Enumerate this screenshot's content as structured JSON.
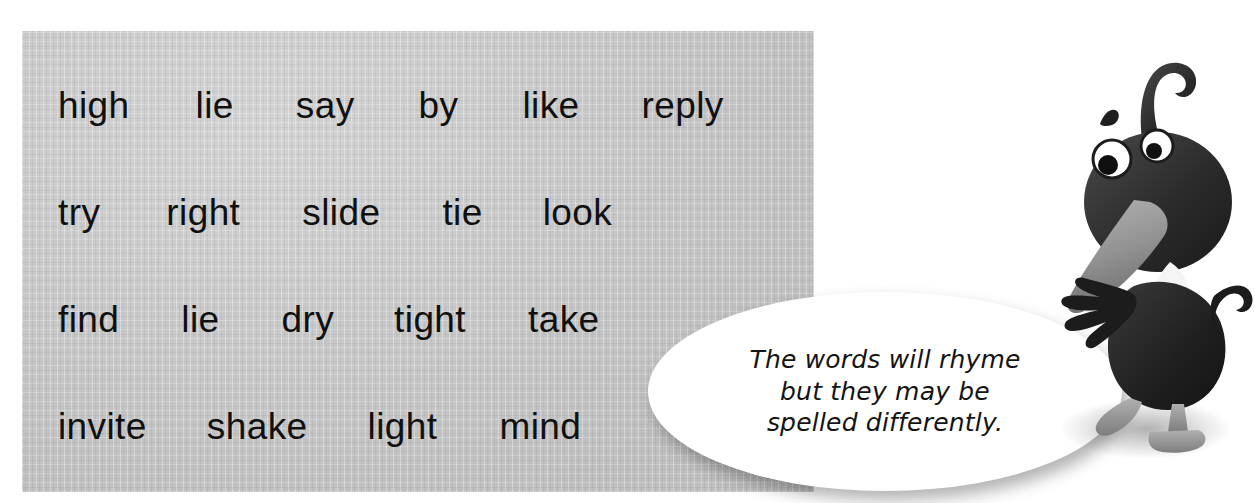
{
  "page": {
    "type": "worksheet-illustration",
    "background_color": "#ffffff"
  },
  "word_panel": {
    "name": "word-list-panel",
    "background_color": "#c9c9c9",
    "text_color": "#101010",
    "rows": [
      {
        "words": [
          "high",
          "lie",
          "say",
          "by",
          "like",
          "reply"
        ]
      },
      {
        "words": [
          "try",
          "right",
          "slide",
          "tie",
          "look"
        ]
      },
      {
        "words": [
          "find",
          "lie",
          "dry",
          "tight",
          "take"
        ]
      },
      {
        "words": [
          "invite",
          "shake",
          "light",
          "mind"
        ]
      }
    ],
    "all_words": [
      "high",
      "lie",
      "say",
      "by",
      "like",
      "reply",
      "try",
      "right",
      "slide",
      "tie",
      "look",
      "find",
      "lie",
      "dry",
      "tight",
      "take",
      "invite",
      "shake",
      "light",
      "mind"
    ]
  },
  "speech_bubble": {
    "name": "speech-bubble",
    "background_color": "#ffffff",
    "text_color": "#141414",
    "lines": [
      "The words will rhyme",
      "but they may be",
      "spelled differently."
    ],
    "full_text": "The words will rhyme but they may be spelled differently."
  },
  "character": {
    "name": "duck-character",
    "description": "cartoon duck with curled topknot feather",
    "body_color": "#242424",
    "beak_color": "#8f8f8f",
    "eye_color": "#ffffff",
    "foot_color": "#9a9a9a"
  }
}
